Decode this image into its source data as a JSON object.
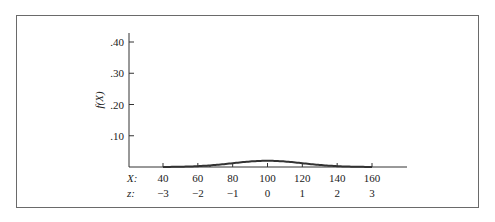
{
  "chart_data": {
    "type": "area",
    "title": "",
    "subtitle": "",
    "mean": 100,
    "sd": 20,
    "xlabel": "X:",
    "zlabel": "z:",
    "ylabel": "f(X)",
    "x_ticks": [
      40,
      60,
      80,
      100,
      120,
      140,
      160
    ],
    "x_tick_labels": [
      "40",
      "60",
      "80",
      "100",
      "120",
      "140",
      "160"
    ],
    "z_tick_labels": [
      "−3",
      "−2",
      "−1",
      "0",
      "1",
      "2",
      "3"
    ],
    "y_ticks": [
      0.1,
      0.2,
      0.3,
      0.4
    ],
    "y_tick_labels": [
      ".10",
      ".20",
      ".30",
      ".40"
    ],
    "xlim": [
      30,
      180
    ],
    "ylim": [
      0,
      0.42
    ],
    "grid": false,
    "legend": null,
    "series": [
      {
        "name": "f(X)",
        "x": [
          40,
          50,
          60,
          70,
          80,
          90,
          100,
          110,
          120,
          130,
          140,
          150,
          160
        ],
        "values": [
          0.0044,
          0.0175,
          0.054,
          0.1295,
          0.242,
          0.352,
          0.399,
          0.352,
          0.242,
          0.1295,
          0.054,
          0.0175,
          0.0044
        ]
      }
    ],
    "shaded_region": {
      "from_x": 40,
      "to_x": 67,
      "height_at_to_x": 0.13,
      "color": "#c8c8c8"
    },
    "curve_color": "#333333"
  }
}
